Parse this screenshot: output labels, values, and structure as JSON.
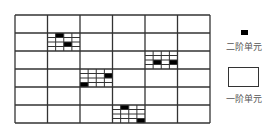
{
  "grid": {
    "cols": 6,
    "rows": 6,
    "cell_w": 32.5,
    "cell_h": 18,
    "line_color": "#333333",
    "refined_subdivisions": 4,
    "refined_cells": [
      {
        "col": 1,
        "row": 1,
        "filled": [
          [
            0,
            1
          ],
          [
            2,
            2
          ]
        ]
      },
      {
        "col": 4,
        "row": 2,
        "filled": [
          [
            2,
            1
          ],
          [
            2,
            3
          ]
        ]
      },
      {
        "col": 2,
        "row": 3,
        "filled": [
          [
            1,
            3
          ],
          [
            3,
            0
          ]
        ]
      },
      {
        "col": 3,
        "row": 5,
        "filled": [
          [
            0,
            1
          ],
          [
            3,
            3
          ]
        ]
      }
    ]
  },
  "legend": {
    "second_order": {
      "label": "二阶单元",
      "icon": "filled-square-icon",
      "color": "#000000"
    },
    "first_order": {
      "label": "一阶单元",
      "icon": "empty-rectangle-icon"
    }
  }
}
